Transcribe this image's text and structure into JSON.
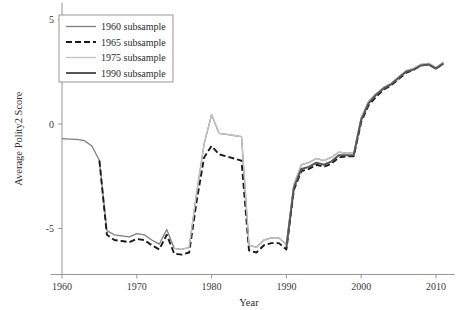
{
  "chart_data": {
    "type": "line",
    "title": "",
    "xlabel": "Year",
    "ylabel": "Average Polity2 Score",
    "xlim": [
      1958.5,
      2012.5
    ],
    "ylim": [
      -7.2,
      5.8
    ],
    "xticks": [
      1960,
      1970,
      1980,
      1990,
      2000,
      2010
    ],
    "xticklabels": [
      "1960",
      "1970",
      "1980",
      "1990",
      "2000",
      "2010"
    ],
    "yticks": [
      5,
      0,
      -5
    ],
    "yticklabels": [
      "5",
      "0",
      "-5"
    ],
    "grid": false,
    "legend_position": "top-left",
    "series": [
      {
        "name": "1960 subsample",
        "color": "#7d7d7d",
        "width": 1.3,
        "dash": "none",
        "x": [
          1960,
          1961,
          1962,
          1963,
          1964,
          1965,
          1966,
          1967,
          1968,
          1969,
          1970,
          1971,
          1972,
          1973,
          1974,
          1975,
          1976,
          1977,
          1978,
          1979,
          1980,
          1981,
          1982,
          1983,
          1984,
          1985,
          1986,
          1987,
          1988,
          1989,
          1990,
          1991,
          1992,
          1993,
          1994,
          1995,
          1996,
          1997,
          1998,
          1999,
          2000,
          2001,
          2002,
          2003,
          2004,
          2005,
          2006,
          2007,
          2008,
          2009,
          2010,
          2011
        ],
        "y": [
          -0.7,
          -0.72,
          -0.74,
          -0.8,
          -1.05,
          -1.75,
          -5.1,
          -5.3,
          -5.35,
          -5.4,
          -5.25,
          -5.3,
          -5.55,
          -5.75,
          -5.05,
          -5.95,
          -6.0,
          -5.9,
          -3.3,
          -0.95,
          0.45,
          -0.45,
          -0.5,
          -0.55,
          -0.6,
          -5.8,
          -5.9,
          -5.55,
          -5.45,
          -5.45,
          -5.75,
          -2.9,
          -1.95,
          -1.85,
          -1.65,
          -1.75,
          -1.6,
          -1.35,
          -1.4,
          -1.4,
          0.3,
          1.1,
          1.45,
          1.75,
          1.95,
          2.25,
          2.55,
          2.65,
          2.85,
          2.9,
          2.7,
          2.95
        ]
      },
      {
        "name": "1965 subsample",
        "color": "#1a1a1a",
        "width": 1.9,
        "dash": "6,3",
        "x": [
          1965,
          1966,
          1967,
          1968,
          1969,
          1970,
          1971,
          1972,
          1973,
          1974,
          1975,
          1976,
          1977,
          1978,
          1979,
          1980,
          1981,
          1982,
          1983,
          1984,
          1985,
          1986,
          1987,
          1988,
          1989,
          1990,
          1991,
          1992,
          1993,
          1994,
          1995,
          1996,
          1997,
          1998,
          1999,
          2000,
          2001,
          2002,
          2003,
          2004,
          2005,
          2006,
          2007,
          2008,
          2009,
          2010,
          2011
        ],
        "y": [
          -1.75,
          -5.3,
          -5.55,
          -5.6,
          -5.65,
          -5.5,
          -5.55,
          -5.8,
          -6.0,
          -5.3,
          -6.2,
          -6.25,
          -6.15,
          -3.7,
          -1.6,
          -1.05,
          -1.45,
          -1.55,
          -1.65,
          -1.75,
          -6.05,
          -6.15,
          -5.8,
          -5.7,
          -5.7,
          -6.0,
          -3.15,
          -2.25,
          -2.15,
          -1.95,
          -2.05,
          -1.9,
          -1.6,
          -1.55,
          -1.55,
          0.1,
          0.9,
          1.3,
          1.65,
          1.85,
          2.15,
          2.45,
          2.6,
          2.8,
          2.85,
          2.65,
          2.9
        ]
      },
      {
        "name": "1975 subsample",
        "color": "#c2c2c2",
        "width": 1.3,
        "dash": "none",
        "x": [
          1975,
          1976,
          1977,
          1978,
          1979,
          1980,
          1981,
          1982,
          1983,
          1984,
          1985,
          1986,
          1987,
          1988,
          1989,
          1990,
          1991,
          1992,
          1993,
          1994,
          1995,
          1996,
          1997,
          1998,
          1999,
          2000,
          2001,
          2002,
          2003,
          2004,
          2005,
          2006,
          2007,
          2008,
          2009,
          2010,
          2011
        ],
        "y": [
          -5.95,
          -6.0,
          -5.9,
          -3.3,
          -0.95,
          0.45,
          -0.45,
          -0.5,
          -0.55,
          -0.6,
          -5.8,
          -5.9,
          -5.55,
          -5.45,
          -5.45,
          -5.75,
          -2.9,
          -1.95,
          -1.85,
          -1.65,
          -1.75,
          -1.6,
          -1.35,
          -1.4,
          -1.4,
          0.3,
          1.1,
          1.45,
          1.75,
          1.95,
          2.25,
          2.55,
          2.65,
          2.85,
          2.9,
          2.7,
          2.95
        ]
      },
      {
        "name": "1990 subsample",
        "color": "#565656",
        "width": 2.0,
        "dash": "none",
        "x": [
          1990,
          1991,
          1992,
          1993,
          1994,
          1995,
          1996,
          1997,
          1998,
          1999,
          2000,
          2001,
          2002,
          2003,
          2004,
          2005,
          2006,
          2007,
          2008,
          2009,
          2010,
          2011
        ],
        "y": [
          -5.9,
          -3.05,
          -2.15,
          -2.05,
          -1.85,
          -1.95,
          -1.8,
          -1.5,
          -1.5,
          -1.5,
          0.2,
          1.0,
          1.4,
          1.7,
          1.9,
          2.2,
          2.5,
          2.6,
          2.8,
          2.85,
          2.65,
          2.9
        ]
      }
    ]
  },
  "legend": {
    "entries": [
      {
        "label": "1960 subsample"
      },
      {
        "label": "1965 subsample"
      },
      {
        "label": "1975 subsample"
      },
      {
        "label": "1990 subsample"
      }
    ]
  }
}
